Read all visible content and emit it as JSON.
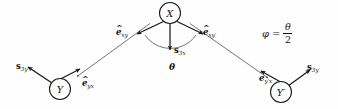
{
  "figure": {
    "background_color": "#fefefe",
    "stroke_color": "#1a1a1a",
    "nodes": [
      {
        "id": "X",
        "label": "X",
        "cx": 170,
        "cy": 13,
        "r": 10.5
      },
      {
        "id": "Y",
        "label": "Y",
        "cx": 60,
        "cy": 89,
        "r": 10.5
      },
      {
        "id": "Yp",
        "label": "Y′",
        "cx": 281,
        "cy": 92,
        "r": 10.5
      }
    ],
    "unit_vectors": [
      {
        "name": "e-hat-xy",
        "hat": "^",
        "base": "e",
        "sub": "xy",
        "x": 116,
        "y": 28
      },
      {
        "name": "e-hat-xyp",
        "hat": "^",
        "base": "e",
        "sub": "xy′",
        "x": 203,
        "y": 28
      },
      {
        "name": "e-hat-yx",
        "hat": "^",
        "base": "e",
        "sub": "yx",
        "x": 82,
        "y": 79
      },
      {
        "name": "e-hat-ypx",
        "hat": "^",
        "base": "e",
        "sub": "y′x",
        "x": 259,
        "y": 74
      }
    ],
    "spins": [
      {
        "name": "spin-3x",
        "base": "s",
        "sub": "3x",
        "x": 174,
        "y": 46
      },
      {
        "name": "spin-3y",
        "base": "s",
        "sub": "3y",
        "x": 16,
        "y": 62
      },
      {
        "name": "spin-3yp",
        "base": "s",
        "sub": "3y′",
        "x": 307,
        "y": 63
      }
    ],
    "angle": {
      "name": "theta-angle",
      "label": "θ",
      "x": 169,
      "y": 63
    },
    "equation": {
      "name": "phi-equation",
      "phi": "φ",
      "equals": "=",
      "numerator": "θ",
      "denominator": "2",
      "x": 262,
      "y": 22
    }
  }
}
